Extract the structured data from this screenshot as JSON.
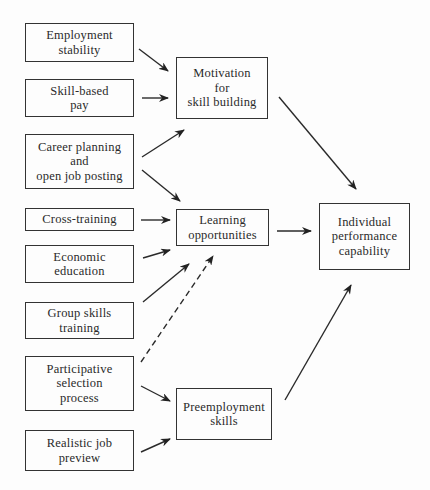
{
  "diagram": {
    "inputs": [
      {
        "id": "employment-stability",
        "label": "Employment\nstability"
      },
      {
        "id": "skill-based-pay",
        "label": "Skill-based\npay"
      },
      {
        "id": "career-planning",
        "label": "Career planning\nand\nopen job posting"
      },
      {
        "id": "cross-training",
        "label": "Cross-training"
      },
      {
        "id": "economic-education",
        "label": "Economic\neducation"
      },
      {
        "id": "group-skills-training",
        "label": "Group skills\ntraining"
      },
      {
        "id": "participative-selection",
        "label": "Participative\nselection\nprocess"
      },
      {
        "id": "realistic-job-preview",
        "label": "Realistic job\npreview"
      }
    ],
    "intermediates": [
      {
        "id": "motivation",
        "label": "Motivation\nfor\nskill building"
      },
      {
        "id": "learning",
        "label": "Learning\nopportunities"
      },
      {
        "id": "preemployment",
        "label": "Preemployment\nskills"
      }
    ],
    "outcome": {
      "id": "performance",
      "label": "Individual\nperformance\ncapability"
    },
    "edges": [
      {
        "from": "employment-stability",
        "to": "motivation",
        "style": "solid"
      },
      {
        "from": "skill-based-pay",
        "to": "motivation",
        "style": "solid"
      },
      {
        "from": "career-planning",
        "to": "motivation",
        "style": "solid"
      },
      {
        "from": "career-planning",
        "to": "learning",
        "style": "solid"
      },
      {
        "from": "cross-training",
        "to": "learning",
        "style": "solid"
      },
      {
        "from": "economic-education",
        "to": "learning",
        "style": "solid"
      },
      {
        "from": "group-skills-training",
        "to": "learning",
        "style": "solid"
      },
      {
        "from": "participative-selection",
        "to": "learning",
        "style": "dashed"
      },
      {
        "from": "participative-selection",
        "to": "preemployment",
        "style": "solid"
      },
      {
        "from": "realistic-job-preview",
        "to": "preemployment",
        "style": "solid"
      },
      {
        "from": "motivation",
        "to": "performance",
        "style": "solid"
      },
      {
        "from": "learning",
        "to": "performance",
        "style": "solid"
      },
      {
        "from": "preemployment",
        "to": "performance",
        "style": "solid"
      }
    ]
  }
}
